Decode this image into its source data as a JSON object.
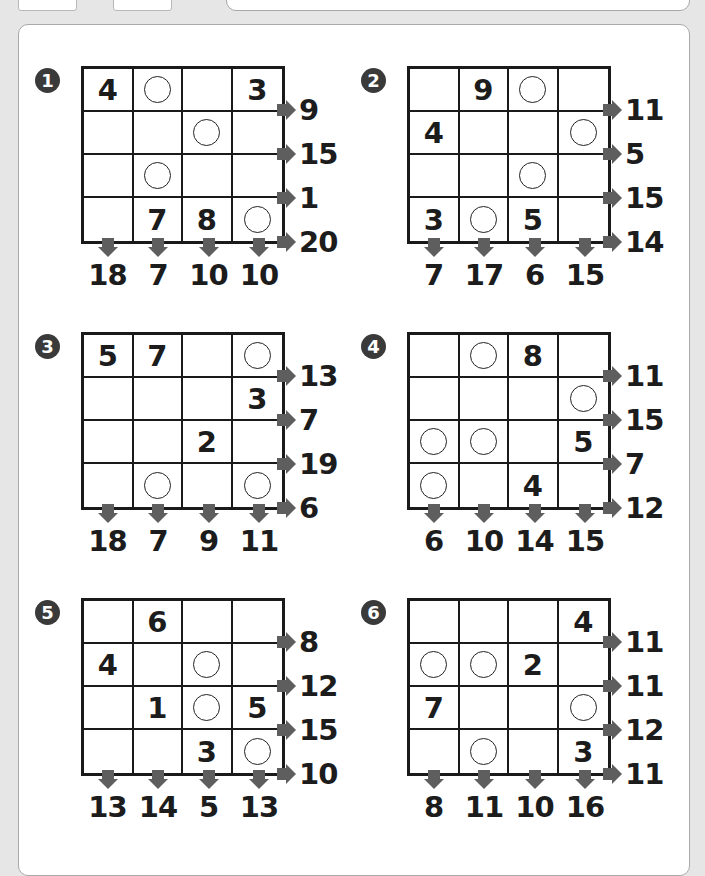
{
  "puzzles": [
    {
      "label": "1",
      "badge": "❶",
      "grid": [
        [
          "4",
          "O",
          "",
          "3"
        ],
        [
          "",
          "",
          "O",
          ""
        ],
        [
          "",
          "O",
          "",
          ""
        ],
        [
          "",
          "7",
          "8",
          "O"
        ]
      ],
      "row_clues": [
        "9",
        "15",
        "1",
        "20"
      ],
      "col_clues": [
        "18",
        "7",
        "10",
        "10"
      ]
    },
    {
      "label": "2",
      "badge": "❷",
      "grid": [
        [
          "",
          "9",
          "O",
          ""
        ],
        [
          "4",
          "",
          "",
          "O"
        ],
        [
          "",
          "",
          "O",
          ""
        ],
        [
          "3",
          "O",
          "5",
          ""
        ]
      ],
      "row_clues": [
        "11",
        "5",
        "15",
        "14"
      ],
      "col_clues": [
        "7",
        "17",
        "6",
        "15"
      ]
    },
    {
      "label": "3",
      "badge": "❸",
      "grid": [
        [
          "5",
          "7",
          "",
          "O"
        ],
        [
          "",
          "",
          "",
          "3"
        ],
        [
          "",
          "",
          "2",
          ""
        ],
        [
          "",
          "O",
          "",
          "O"
        ]
      ],
      "row_clues": [
        "13",
        "7",
        "19",
        "6"
      ],
      "col_clues": [
        "18",
        "7",
        "9",
        "11"
      ]
    },
    {
      "label": "4",
      "badge": "❹",
      "grid": [
        [
          "",
          "O",
          "8",
          ""
        ],
        [
          "",
          "",
          "",
          "O"
        ],
        [
          "O",
          "O",
          "",
          "5"
        ],
        [
          "O",
          "",
          "4",
          ""
        ]
      ],
      "row_clues": [
        "11",
        "15",
        "7",
        "12"
      ],
      "col_clues": [
        "6",
        "10",
        "14",
        "15"
      ]
    },
    {
      "label": "5",
      "badge": "❺",
      "grid": [
        [
          "",
          "6",
          "",
          ""
        ],
        [
          "4",
          "",
          "O",
          ""
        ],
        [
          "",
          "1",
          "O",
          "5"
        ],
        [
          "",
          "",
          "3",
          "O"
        ]
      ],
      "row_clues": [
        "8",
        "12",
        "15",
        "10"
      ],
      "col_clues": [
        "13",
        "14",
        "5",
        "13"
      ]
    },
    {
      "label": "6",
      "badge": "❻",
      "grid": [
        [
          "",
          "",
          "",
          "4"
        ],
        [
          "O",
          "O",
          "2",
          ""
        ],
        [
          "7",
          "",
          "",
          "O"
        ],
        [
          "",
          "O",
          "",
          "3"
        ]
      ],
      "row_clues": [
        "11",
        "11",
        "12",
        "11"
      ],
      "col_clues": [
        "8",
        "11",
        "10",
        "16"
      ]
    }
  ],
  "colors": {
    "grid_line": "#1a1a1a",
    "arrow": "#5e5e5e",
    "badge": "#3a3a3a",
    "background": "#e6e6e6",
    "panel": "#ffffff"
  }
}
